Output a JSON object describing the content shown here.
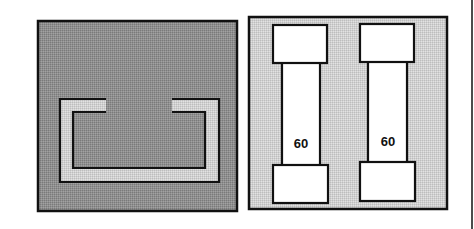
{
  "diagram": {
    "panels": [
      {
        "id": "left-panel",
        "description": "Empty fuse holder with open rectangular bracket contacts",
        "background": "#8f8f8f",
        "bracket_fill": "#d2d2d2"
      },
      {
        "id": "right-panel",
        "description": "Fuse holder with two installed cartridge fuses",
        "background": "#cfcfcf",
        "fuses": [
          {
            "label": "60"
          },
          {
            "label": "60"
          }
        ]
      }
    ],
    "colors": {
      "stroke": "#111111",
      "fuse_fill": "#ffffff"
    }
  }
}
